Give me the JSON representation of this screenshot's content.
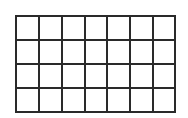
{
  "diagram": {
    "type": "grid",
    "columns": 7,
    "rows": 4,
    "line_color": "#2a2a2a",
    "background": "#ffffff",
    "line_width": 2,
    "x_lines": [
      16,
      39,
      62,
      85,
      107,
      130,
      153,
      175
    ],
    "y_lines": [
      16,
      40,
      64,
      88,
      112
    ]
  }
}
